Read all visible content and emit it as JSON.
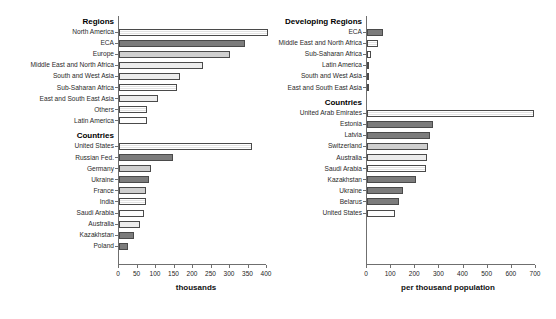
{
  "figure": {
    "faint_title": "",
    "panels": [
      {
        "id": "left",
        "axis_title": "thousands",
        "xlim": [
          0,
          400
        ],
        "xticks": [
          0,
          50,
          100,
          150,
          200,
          250,
          300,
          350,
          400
        ],
        "groups": [
          {
            "title": "Regions",
            "rows": [
              {
                "label": "North America",
                "value": 404,
                "fill": "f-hatch"
              },
              {
                "label": "ECA",
                "value": 341,
                "fill": "f-dark"
              },
              {
                "label": "Europe",
                "value": 299,
                "fill": "f-mid"
              },
              {
                "label": "Middle East and North Africa",
                "value": 228,
                "fill": "f-light"
              },
              {
                "label": "South and West Asia",
                "value": 164,
                "fill": "f-light"
              },
              {
                "label": "Sub-Saharan Africa",
                "value": 157,
                "fill": "f-hatch"
              },
              {
                "label": "East and South East Asia",
                "value": 106,
                "fill": "f-light"
              },
              {
                "label": "Others",
                "value": 76,
                "fill": "f-hatch"
              },
              {
                "label": "Latin America",
                "value": 75,
                "fill": "f-white"
              }
            ]
          },
          {
            "title": "Countries",
            "rows": [
              {
                "label": "United States",
                "value": 360,
                "fill": "f-hatch"
              },
              {
                "label": "Russian Fed.",
                "value": 146,
                "fill": "f-dark"
              },
              {
                "label": "Germany",
                "value": 87,
                "fill": "f-mid"
              },
              {
                "label": "Ukraine",
                "value": 81,
                "fill": "f-dark"
              },
              {
                "label": "France",
                "value": 73,
                "fill": "f-mid"
              },
              {
                "label": "India",
                "value": 72,
                "fill": "f-hatch"
              },
              {
                "label": "Saudi Arabia",
                "value": 67,
                "fill": "f-white"
              },
              {
                "label": "Australia",
                "value": 57,
                "fill": "f-light"
              },
              {
                "label": "Kazakhstan",
                "value": 40,
                "fill": "f-dark"
              },
              {
                "label": "Poland",
                "value": 25,
                "fill": "f-dark"
              }
            ]
          }
        ]
      },
      {
        "id": "right",
        "axis_title": "per thousand population",
        "xlim": [
          0,
          700
        ],
        "xticks": [
          0,
          100,
          200,
          300,
          400,
          500,
          600,
          700
        ],
        "groups": [
          {
            "title": "Developing Regions",
            "rows": [
              {
                "label": "ECA",
                "value": 68,
                "fill": "f-dark"
              },
              {
                "label": "Middle East and North Africa",
                "value": 46,
                "fill": "f-hatch"
              },
              {
                "label": "Sub-Saharan Africa",
                "value": 16,
                "fill": "f-white"
              },
              {
                "label": "Latin America",
                "value": 10,
                "fill": "f-white"
              },
              {
                "label": "South and West Asia",
                "value": 9,
                "fill": "f-white"
              },
              {
                "label": "East and South East Asia",
                "value": 7,
                "fill": "f-white"
              }
            ]
          },
          {
            "title": "Countries",
            "rows": [
              {
                "label": "United Arab Emirates",
                "value": 690,
                "fill": "f-hatch"
              },
              {
                "label": "Estonia",
                "value": 274,
                "fill": "f-dark"
              },
              {
                "label": "Latvia",
                "value": 262,
                "fill": "f-dark"
              },
              {
                "label": "Switzerland",
                "value": 254,
                "fill": "f-mid"
              },
              {
                "label": "Australia",
                "value": 249,
                "fill": "f-light"
              },
              {
                "label": "Saudi Arabia",
                "value": 245,
                "fill": "f-hatch"
              },
              {
                "label": "Kazakhstan",
                "value": 204,
                "fill": "f-dark"
              },
              {
                "label": "Ukraine",
                "value": 150,
                "fill": "f-dark"
              },
              {
                "label": "Belarus",
                "value": 133,
                "fill": "f-dark"
              },
              {
                "label": "United States",
                "value": 117,
                "fill": "f-white"
              }
            ]
          }
        ]
      }
    ]
  },
  "chart_data": [
    {
      "type": "bar",
      "title": "",
      "orientation": "horizontal",
      "xlabel": "thousands",
      "ylabel": "",
      "xlim": [
        0,
        400
      ],
      "xticks": [
        0,
        50,
        100,
        150,
        200,
        250,
        300,
        350,
        400
      ],
      "grid": false,
      "legend": "none",
      "groups": [
        {
          "name": "Regions",
          "categories": [
            "North America",
            "ECA",
            "Europe",
            "Middle East and North Africa",
            "South and West Asia",
            "Sub-Saharan Africa",
            "East and South East Asia",
            "Others",
            "Latin America"
          ],
          "values": [
            404,
            341,
            299,
            228,
            164,
            157,
            106,
            76,
            75
          ]
        },
        {
          "name": "Countries",
          "categories": [
            "United States",
            "Russian Fed.",
            "Germany",
            "Ukraine",
            "France",
            "India",
            "Saudi Arabia",
            "Australia",
            "Kazakhstan",
            "Poland"
          ],
          "values": [
            360,
            146,
            87,
            81,
            73,
            72,
            67,
            57,
            40,
            25
          ]
        }
      ]
    },
    {
      "type": "bar",
      "title": "",
      "orientation": "horizontal",
      "xlabel": "per thousand population",
      "ylabel": "",
      "xlim": [
        0,
        700
      ],
      "xticks": [
        0,
        100,
        200,
        300,
        400,
        500,
        600,
        700
      ],
      "grid": false,
      "legend": "none",
      "groups": [
        {
          "name": "Developing Regions",
          "categories": [
            "ECA",
            "Middle East and North Africa",
            "Sub-Saharan Africa",
            "Latin America",
            "South and West Asia",
            "East and South East Asia"
          ],
          "values": [
            68,
            46,
            16,
            10,
            9,
            7
          ]
        },
        {
          "name": "Countries",
          "categories": [
            "United Arab Emirates",
            "Estonia",
            "Latvia",
            "Switzerland",
            "Australia",
            "Saudi Arabia",
            "Kazakhstan",
            "Ukraine",
            "Belarus",
            "United States"
          ],
          "values": [
            690,
            274,
            262,
            254,
            249,
            245,
            204,
            150,
            133,
            117
          ]
        }
      ]
    }
  ]
}
